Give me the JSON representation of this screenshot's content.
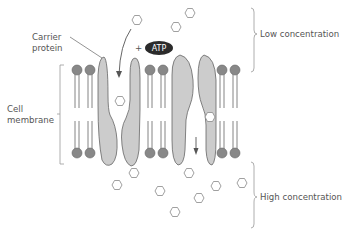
{
  "labels": {
    "carrier_protein_line1": "Carrier",
    "carrier_protein_line2": "protein",
    "cell_membrane_line1": "Cell",
    "cell_membrane_line2": "membrane",
    "low_concentration": "Low concentration",
    "high_concentration": "High concentration",
    "plus_sign": "+",
    "atp": "ATP"
  },
  "colors": {
    "protein_fill": "#cccccc",
    "outline": "#666666",
    "lipid_head": "#888888",
    "atp_fill": "#2b2b2b",
    "text": "#555555",
    "bracket": "#999999"
  },
  "molecules": {
    "top_outside": [
      {
        "x": 137,
        "y": 20
      },
      {
        "x": 176,
        "y": 27
      },
      {
        "x": 190,
        "y": 13
      }
    ],
    "in_channel": [
      {
        "x": 120,
        "y": 101
      },
      {
        "x": 210,
        "y": 117
      }
    ],
    "bottom_outside": [
      {
        "x": 117,
        "y": 185
      },
      {
        "x": 134,
        "y": 173
      },
      {
        "x": 160,
        "y": 191
      },
      {
        "x": 189,
        "y": 173
      },
      {
        "x": 199,
        "y": 198
      },
      {
        "x": 216,
        "y": 186
      },
      {
        "x": 175,
        "y": 212
      },
      {
        "x": 246,
        "y": 175
      }
    ]
  }
}
